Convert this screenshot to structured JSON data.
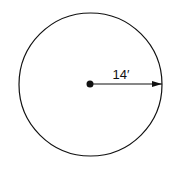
{
  "diagram": {
    "shape": "circle",
    "radius_label": "14′",
    "colors": {
      "stroke": "#111111",
      "background": "#ffffff"
    }
  }
}
